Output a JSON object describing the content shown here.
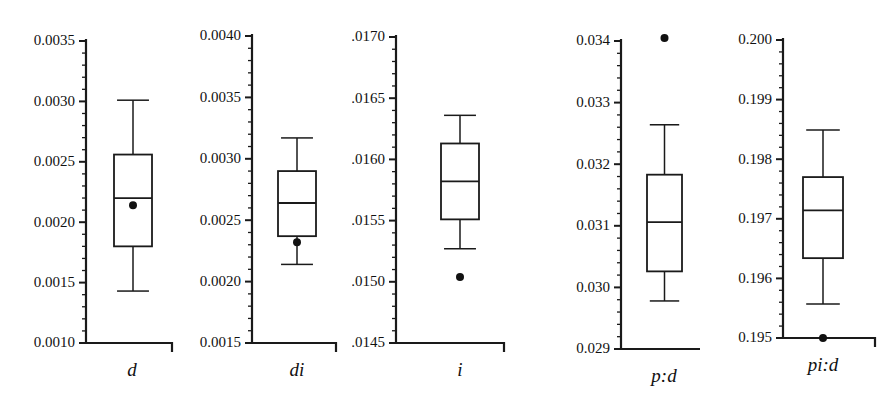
{
  "figure": {
    "type": "boxplot-panel-series",
    "background": "#ffffff",
    "ink_color": "#1a1a1a",
    "panel_count": 5
  },
  "chart_data": {
    "type": "box",
    "title": "",
    "xlabel": "",
    "ylabel": "",
    "grid": false,
    "legend": false,
    "orientation": "vertical",
    "note": "Five separate box-and-whisker panels, each with its own y-axis scale; filled dots are individual observations/outliers.",
    "panels": [
      {
        "id": "panel-d",
        "label": "d",
        "ylim": [
          0.001,
          0.0035
        ],
        "ytick_labels": [
          "0.0035",
          "0.0030",
          "0.0025",
          "0.0020",
          "0.0015",
          "0.0010"
        ],
        "ytick_values": [
          0.0035,
          0.003,
          0.0025,
          0.002,
          0.0015,
          0.001
        ],
        "minor_ticks_per_interval": 4,
        "box": {
          "whisker_high": 0.00301,
          "q3": 0.00256,
          "median": 0.0022,
          "q1": 0.0018,
          "whisker_low": 0.00143
        },
        "points": [
          0.00214
        ]
      },
      {
        "id": "panel-di",
        "label": "di",
        "ylim": [
          0.0015,
          0.004
        ],
        "ytick_labels": [
          "0.0040",
          "0.0035",
          "0.0030",
          "0.0025",
          "0.0020",
          "0.0015"
        ],
        "ytick_values": [
          0.004,
          0.0035,
          0.003,
          0.0025,
          0.002,
          0.0015
        ],
        "minor_ticks_per_interval": 4,
        "box": {
          "whisker_high": 0.00317,
          "q3": 0.0029,
          "median": 0.00264,
          "q1": 0.00237,
          "whisker_low": 0.00214
        },
        "points": [
          0.00232
        ]
      },
      {
        "id": "panel-i",
        "label": "i",
        "ylim": [
          0.0145,
          0.017
        ],
        "ytick_labels": [
          "0.0170",
          "0.0165",
          "0.0160",
          "0.0155",
          "0.0150",
          "0.0145"
        ],
        "ytick_values": [
          0.017,
          0.0165,
          0.016,
          0.0155,
          0.015,
          0.0145
        ],
        "minor_ticks_per_interval": 4,
        "box": {
          "whisker_high": 0.01636,
          "q3": 0.01613,
          "median": 0.01582,
          "q1": 0.01551,
          "whisker_low": 0.01527
        },
        "points": [
          0.01504
        ]
      },
      {
        "id": "panel-p-d",
        "label": "p:d",
        "ylim": [
          0.029,
          0.034
        ],
        "ytick_labels": [
          "0.034",
          "0.033",
          "0.032",
          "0.031",
          "0.030",
          "0.029"
        ],
        "ytick_values": [
          0.034,
          0.033,
          0.032,
          0.031,
          0.03,
          0.029
        ],
        "minor_ticks_per_interval": 4,
        "box": {
          "whisker_high": 0.03264,
          "q3": 0.03183,
          "median": 0.03106,
          "q1": 0.03026,
          "whisker_low": 0.02978
        },
        "points": [
          0.03405
        ]
      },
      {
        "id": "panel-pi-d",
        "label": "pi:d",
        "ylim": [
          0.195,
          0.2
        ],
        "ytick_labels": [
          "0.200",
          "0.199",
          "0.198",
          "0.197",
          "0.196",
          "0.195"
        ],
        "ytick_values": [
          0.2,
          0.199,
          0.198,
          0.197,
          0.196,
          0.195
        ],
        "minor_ticks_per_interval": 4,
        "box": {
          "whisker_high": 0.19849,
          "q3": 0.1977,
          "median": 0.19714,
          "q1": 0.19634,
          "whisker_low": 0.19557
        },
        "points": [
          0.195
        ]
      }
    ]
  }
}
